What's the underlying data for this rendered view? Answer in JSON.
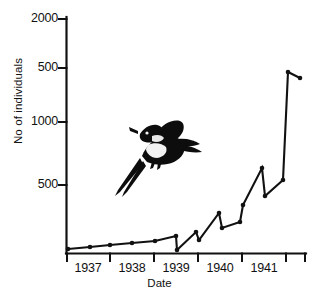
{
  "figure": {
    "name": "pheasant-population-growth-chart",
    "background": "#ffffff",
    "ink_color": "#111111"
  },
  "axes": {
    "y": {
      "label": "No of individuals",
      "tick_labels": [
        "2000",
        "500",
        "1000",
        "500"
      ],
      "tick_pixel_y": [
        19,
        68,
        122,
        185
      ],
      "axis_top_y": 17,
      "axis_bottom_y": 253
    },
    "x": {
      "label": "Date",
      "tick_labels": [
        "1937",
        "1938",
        "1939",
        "1940",
        "1941"
      ],
      "tick_pixel_x": [
        66,
        110,
        154,
        198,
        242,
        286,
        306
      ],
      "label_center_x": [
        88,
        132,
        176,
        220,
        264
      ],
      "axis_left_x": 66,
      "axis_right_x": 306,
      "axis_y": 253
    }
  },
  "illustration": {
    "name": "flying-pheasant-illustration",
    "description": "flying pheasant"
  },
  "chart_data": {
    "type": "line",
    "title": "",
    "xlabel": "Date",
    "ylabel": "No of individuals",
    "xtick_labels": [
      "1937",
      "1938",
      "1939",
      "1940",
      "1941"
    ],
    "ytick_labels": [
      "2000",
      "500",
      "1000",
      "500"
    ],
    "grid": false,
    "legend": null,
    "marker": "filled-circle",
    "series": [
      {
        "name": "No of individuals",
        "points_pixel": [
          [
            68,
            249
          ],
          [
            90,
            247
          ],
          [
            110,
            245
          ],
          [
            132,
            243
          ],
          [
            155,
            241
          ],
          [
            176,
            236
          ],
          [
            177,
            250
          ],
          [
            196,
            232
          ],
          [
            199,
            240
          ],
          [
            219,
            213
          ],
          [
            222,
            228
          ],
          [
            240,
            222
          ],
          [
            243,
            205
          ],
          [
            262,
            168
          ],
          [
            265,
            196
          ],
          [
            283,
            180
          ],
          [
            288,
            72
          ],
          [
            300,
            78
          ]
        ],
        "values": [
          12,
          18,
          24,
          32,
          42,
          60,
          14,
          78,
          45,
          140,
          95,
          115,
          175,
          330,
          205,
          280,
          1850,
          1720
        ]
      }
    ]
  }
}
